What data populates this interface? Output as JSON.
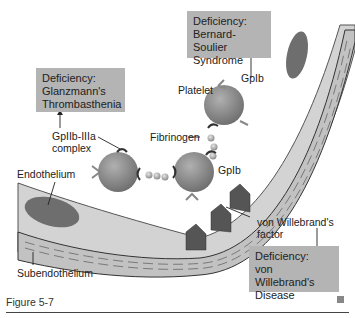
{
  "figure_label": "Figure 5-7",
  "boxes": {
    "glanzmann": {
      "line1": "Deficiency:",
      "line2": "Glanzmann's",
      "line3": "Thrombasthenia"
    },
    "bernard": {
      "line1": "Deficiency:",
      "line2": "Bernard-Soulier",
      "line3": "Syndrome"
    },
    "vwd": {
      "line1": "Deficiency:",
      "line2": "von Willebrand's",
      "line3": "Disease"
    }
  },
  "labels": {
    "gpiib_1": "GpIIb-IIIa",
    "gpiib_2": "complex",
    "platelet": "Platelet",
    "fibrinogen": "Fibrinogen",
    "gpib_top": "GpIb",
    "gpib_mid": "GpIb",
    "endothelium": "Endothelium",
    "subendothelium": "Subendothelium",
    "vwf_1": "von Willebrand's",
    "vwf_2": "factor"
  },
  "colors": {
    "box_fill": "#b4b4b4",
    "platelet": "#8a8a8a",
    "vessel": "#cfcfcf",
    "vwf": "#555555"
  }
}
